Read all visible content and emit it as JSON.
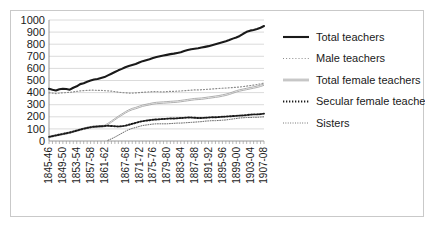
{
  "chart_data": {
    "type": "line",
    "title": "",
    "xlabel": "",
    "ylabel": "",
    "ylim": [
      0,
      1000
    ],
    "yticks": [
      0,
      100,
      200,
      300,
      400,
      500,
      600,
      700,
      800,
      900,
      1000
    ],
    "grid": "horizontal",
    "legend_position": "right",
    "x": [
      "1845-46",
      "1846-47",
      "1847-48",
      "1848-49",
      "1849-50",
      "1850-51",
      "1851-52",
      "1852-53",
      "1853-54",
      "1854-55",
      "1855-56",
      "1856-57",
      "1857-58",
      "1858-59",
      "1859-60",
      "1860-61",
      "1861-62",
      "1862-63",
      "1863-64",
      "1864-65",
      "1865-66",
      "1866-67",
      "1867-68",
      "1868-69",
      "1869-70",
      "1870-71",
      "1871-72",
      "1872-73",
      "1873-74",
      "1874-75",
      "1875-76",
      "1876-77",
      "1877-78",
      "1878-79",
      "1879-80",
      "1880-81",
      "1881-82",
      "1882-83",
      "1883-84",
      "1884-85",
      "1885-86",
      "1886-87",
      "1887-88",
      "1888-89",
      "1889-90",
      "1890-91",
      "1891-92",
      "1892-93",
      "1893-94",
      "1894-95",
      "1895-96",
      "1896-97",
      "1897-98",
      "1898-99",
      "1899-00",
      "1900-01",
      "1901-02",
      "1902-03",
      "1903-04",
      "1904-05",
      "1905-06",
      "1906-07",
      "1907-08"
    ],
    "xtick_labels": [
      "1845-46",
      "1849-50",
      "1853-54",
      "1857-58",
      "1861-62",
      "1867-68",
      "1871-72",
      "1875-76",
      "1879-80",
      "1883-84",
      "1887-88",
      "1891-92",
      "1895-96",
      "1899-00",
      "1903-04",
      "1907-08"
    ],
    "xtick_indices": [
      0,
      4,
      8,
      12,
      16,
      22,
      26,
      30,
      34,
      38,
      42,
      46,
      50,
      54,
      58,
      62
    ],
    "series": [
      {
        "name": "Total teachers",
        "style": "thick-solid",
        "color": "#1a1a1a",
        "values": [
          432,
          424,
          418,
          428,
          432,
          430,
          424,
          440,
          452,
          470,
          478,
          490,
          500,
          508,
          512,
          520,
          528,
          542,
          556,
          570,
          584,
          596,
          610,
          620,
          628,
          636,
          648,
          660,
          668,
          676,
          686,
          694,
          700,
          706,
          712,
          718,
          722,
          728,
          734,
          744,
          752,
          758,
          762,
          766,
          772,
          778,
          784,
          792,
          800,
          808,
          816,
          824,
          834,
          846,
          856,
          868,
          886,
          902,
          912,
          918,
          926,
          936,
          950
        ]
      },
      {
        "name": "Male teachers",
        "style": "light-dotted",
        "color": "#8c8c8c",
        "values": [
          398,
          396,
          392,
          396,
          398,
          400,
          402,
          406,
          410,
          414,
          416,
          418,
          420,
          420,
          418,
          418,
          416,
          414,
          412,
          408,
          404,
          400,
          398,
          396,
          396,
          398,
          400,
          402,
          404,
          406,
          408,
          408,
          406,
          406,
          408,
          410,
          410,
          412,
          414,
          416,
          418,
          420,
          422,
          422,
          424,
          426,
          428,
          430,
          432,
          434,
          436,
          438,
          440,
          442,
          444,
          446,
          450,
          454,
          458,
          462,
          466,
          472,
          480
        ]
      },
      {
        "name": "Total female teachers",
        "style": "thin-gray",
        "color": "#a6a6a6",
        "values": [
          34,
          40,
          46,
          52,
          58,
          64,
          70,
          78,
          86,
          94,
          102,
          108,
          114,
          118,
          120,
          122,
          124,
          140,
          160,
          180,
          200,
          218,
          236,
          252,
          264,
          272,
          282,
          292,
          298,
          304,
          310,
          314,
          316,
          318,
          320,
          322,
          324,
          326,
          330,
          334,
          338,
          342,
          346,
          348,
          350,
          354,
          358,
          362,
          366,
          370,
          376,
          382,
          390,
          400,
          410,
          418,
          424,
          430,
          436,
          442,
          448,
          456,
          466
        ]
      },
      {
        "name": "Secular female teachers",
        "style": "bold-dotted",
        "color": "#1a1a1a",
        "values": [
          34,
          40,
          46,
          52,
          58,
          64,
          70,
          78,
          86,
          94,
          102,
          108,
          114,
          118,
          120,
          122,
          124,
          126,
          124,
          122,
          120,
          122,
          126,
          134,
          142,
          150,
          158,
          164,
          168,
          172,
          176,
          178,
          180,
          182,
          184,
          186,
          186,
          188,
          190,
          192,
          194,
          194,
          192,
          190,
          190,
          192,
          194,
          196,
          196,
          198,
          200,
          202,
          204,
          206,
          208,
          210,
          212,
          214,
          218,
          220,
          220,
          222,
          226
        ]
      },
      {
        "name": "Sisters",
        "style": "fine-dotted",
        "color": "#595959",
        "values": [
          0,
          0,
          0,
          0,
          0,
          0,
          0,
          0,
          0,
          0,
          0,
          0,
          0,
          0,
          0,
          0,
          0,
          6,
          18,
          32,
          48,
          64,
          80,
          94,
          104,
          112,
          120,
          128,
          132,
          136,
          140,
          142,
          142,
          142,
          142,
          144,
          146,
          148,
          148,
          150,
          152,
          154,
          156,
          158,
          160,
          164,
          166,
          168,
          168,
          170,
          172,
          174,
          178,
          182,
          186,
          190,
          192,
          194,
          194,
          196,
          196,
          198,
          200
        ]
      }
    ]
  },
  "legend": {
    "items": [
      {
        "label": "Total teachers"
      },
      {
        "label": "Male teachers"
      },
      {
        "label": "Total female teachers"
      },
      {
        "label": "Secular female teachers"
      },
      {
        "label": "Sisters"
      }
    ]
  }
}
